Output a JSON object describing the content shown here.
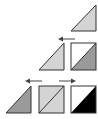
{
  "diagram": {
    "title": "",
    "colors": {
      "background": "#ffffff",
      "stroke": "#333333",
      "light_grey": "#d4d4d4",
      "mid_grey": "#9a9a9a",
      "black": "#000000",
      "white": "#ffffff",
      "arrow": "#444444"
    },
    "rows": [
      {
        "id": "row-1",
        "shapes": [
          {
            "type": "triangle",
            "fill": "light_grey",
            "orientation": "right-angle-bottom-right"
          }
        ],
        "arrows": []
      },
      {
        "id": "row-2",
        "shapes": [
          {
            "type": "triangle",
            "fill": "light_grey",
            "orientation": "right-angle-bottom-right"
          },
          {
            "type": "split-square",
            "upper_left": "white",
            "lower_right": "mid_grey"
          }
        ],
        "arrows": [
          {
            "direction": "left"
          }
        ]
      },
      {
        "id": "row-3",
        "shapes": [
          {
            "type": "triangle",
            "fill": "mid_grey",
            "orientation": "right-angle-bottom-right"
          },
          {
            "type": "split-square",
            "upper_left": "light_grey",
            "lower_right": "light_grey"
          },
          {
            "type": "split-square",
            "upper_left": "white",
            "lower_right": "black"
          }
        ],
        "arrows": [
          {
            "direction": "left"
          },
          {
            "direction": "right"
          }
        ]
      }
    ]
  }
}
